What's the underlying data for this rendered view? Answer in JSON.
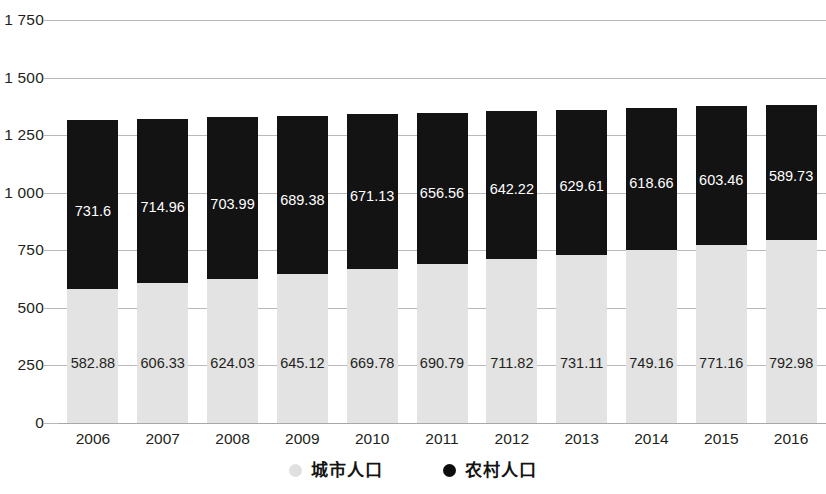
{
  "chart_data": {
    "type": "bar",
    "stacked": true,
    "title": "",
    "subtitle": "",
    "xlabel": "",
    "ylabel": "",
    "categories": [
      "2006",
      "2007",
      "2008",
      "2009",
      "2010",
      "2011",
      "2012",
      "2013",
      "2014",
      "2015",
      "2016"
    ],
    "series": [
      {
        "name": "城市人口",
        "color": "#e3e3e3",
        "values": [
          582.88,
          606.33,
          624.03,
          645.12,
          669.78,
          690.79,
          711.82,
          731.11,
          749.16,
          771.16,
          792.98
        ],
        "labels": [
          "582.88",
          "606.33",
          "624.03",
          "645.12",
          "669.78",
          "690.79",
          "711.82",
          "731.11",
          "749.16",
          "771.16",
          "792.98"
        ]
      },
      {
        "name": "农村人口",
        "color": "#131313",
        "values": [
          731.6,
          714.96,
          703.99,
          689.38,
          671.13,
          656.56,
          642.22,
          629.61,
          618.66,
          603.46,
          589.73
        ],
        "labels": [
          "731.6",
          "714.96",
          "703.99",
          "689.38",
          "671.13",
          "656.56",
          "642.22",
          "629.61",
          "618.66",
          "603.46",
          "589.73"
        ]
      }
    ],
    "ylim": [
      0,
      1750
    ],
    "yticks": [
      0,
      250,
      500,
      750,
      1000,
      1250,
      1500,
      1750
    ],
    "ytick_labels": [
      "0",
      "250",
      "500",
      "750",
      "1 000",
      "1 250",
      "1 500",
      "1 750"
    ],
    "grid": "horizontal",
    "legend_position": "bottom"
  },
  "legend": {
    "items": [
      {
        "label": "城市人口",
        "marker": "circle-light-gray"
      },
      {
        "label": "农村人口",
        "marker": "circle-black"
      }
    ]
  }
}
